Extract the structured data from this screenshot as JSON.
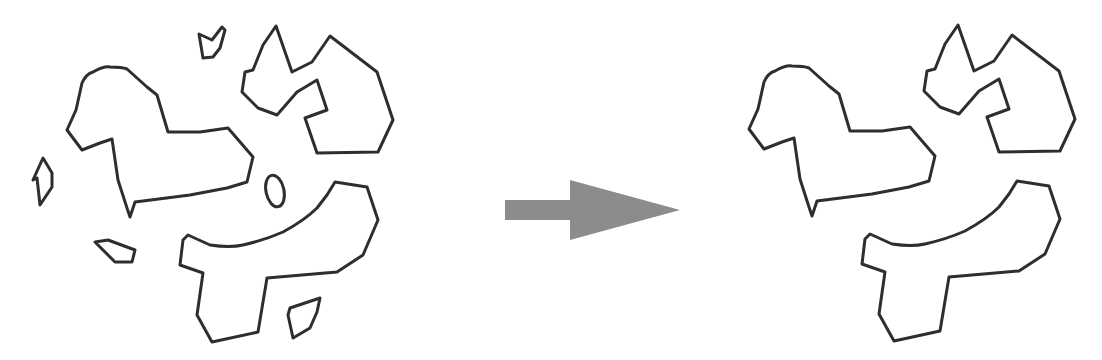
{
  "figure": {
    "colors": {
      "background": "#ffffff",
      "outline": "#2e2e2e",
      "arrow": "#8c8c8c"
    },
    "before": {
      "label": "",
      "main_shapes": [
        "heart-shape",
        "crown-shape",
        "hook-shape",
        "oval-shape"
      ],
      "small_fragments": [
        "top-shard",
        "left-shard",
        "lower-left-shard",
        "bottom-shard"
      ]
    },
    "arrow": {
      "direction": "right"
    },
    "after": {
      "label": "",
      "main_shapes": [
        "heart-shape",
        "crown-shape",
        "hook-shape"
      ]
    }
  }
}
